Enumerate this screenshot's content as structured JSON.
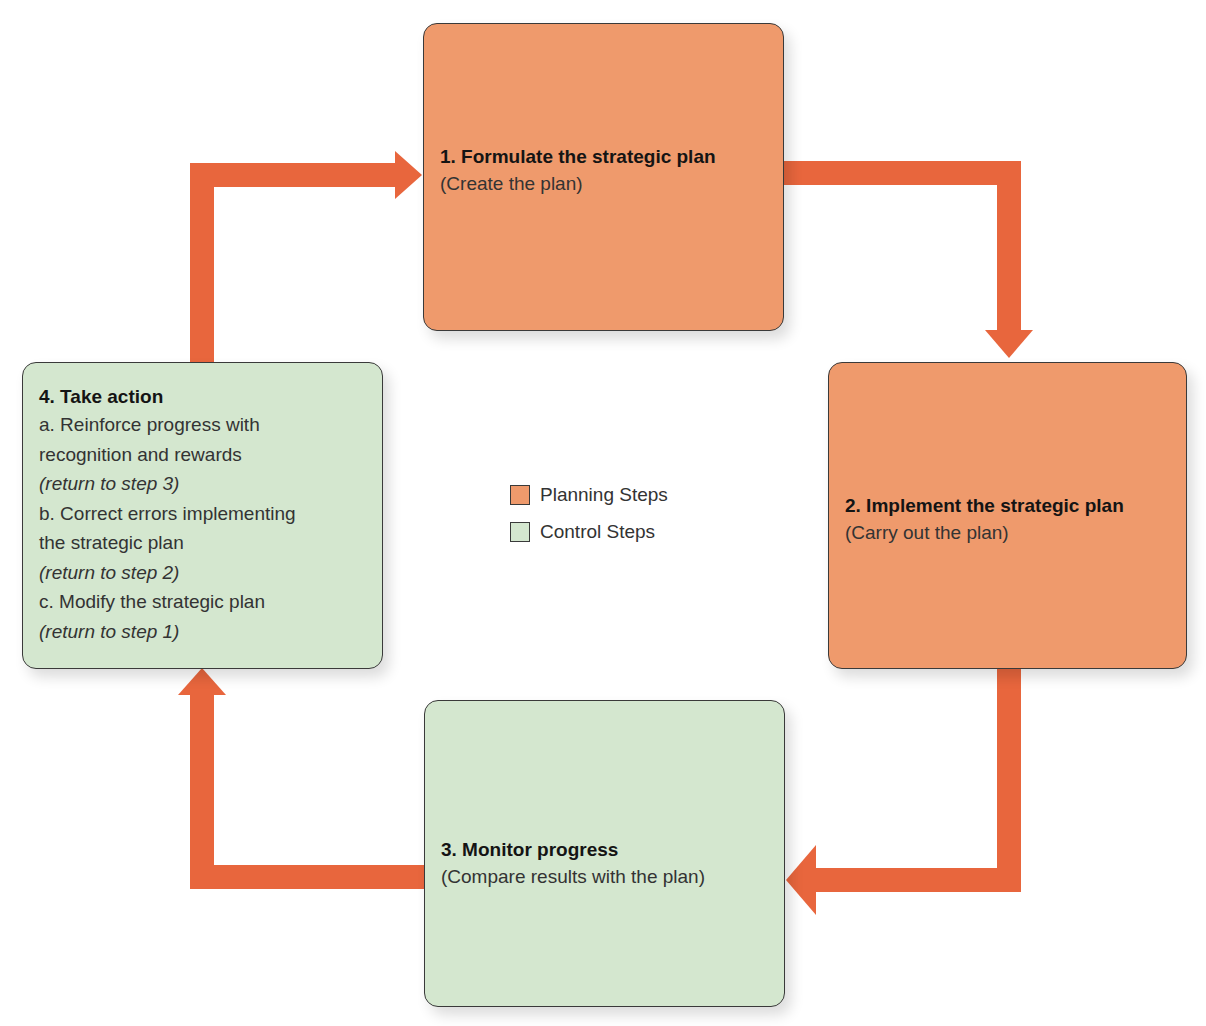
{
  "diagram": {
    "type": "cycle",
    "colors": {
      "planning": "#ef9a6c",
      "control": "#d4e7cf",
      "arrow": "#e8663d",
      "border": "#3a3a3a"
    },
    "steps": [
      {
        "id": 1,
        "category": "planning",
        "title": "1. Formulate the strategic plan",
        "subtitle": "(Create the plan)"
      },
      {
        "id": 2,
        "category": "planning",
        "title": "2. Implement the strategic plan",
        "subtitle": "(Carry out the plan)"
      },
      {
        "id": 3,
        "category": "control",
        "title": "3. Monitor progress",
        "subtitle": "(Compare results with the plan)"
      },
      {
        "id": 4,
        "category": "control",
        "title": "4. Take action",
        "lines": [
          {
            "text": "a. Reinforce progress with",
            "italic": false
          },
          {
            "text": "recognition and rewards",
            "italic": false
          },
          {
            "text": "(return to step 3)",
            "italic": true
          },
          {
            "text": "b. Correct errors implementing",
            "italic": false
          },
          {
            "text": "the strategic plan",
            "italic": false
          },
          {
            "text": "(return to step 2)",
            "italic": true
          },
          {
            "text": "c. Modify the strategic plan",
            "italic": false
          },
          {
            "text": "(return to step 1)",
            "italic": true
          }
        ]
      }
    ],
    "arrows": [
      {
        "from": 1,
        "to": 2
      },
      {
        "from": 2,
        "to": 3
      },
      {
        "from": 3,
        "to": 4
      },
      {
        "from": 4,
        "to": 1
      }
    ],
    "legend": [
      {
        "label": "Planning Steps",
        "category": "planning"
      },
      {
        "label": "Control Steps",
        "category": "control"
      }
    ]
  }
}
